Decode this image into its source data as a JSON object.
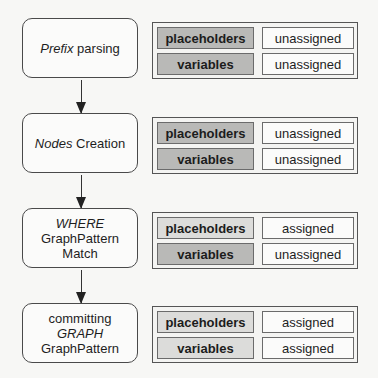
{
  "colors": {
    "label_unassigned": "#b9b9b7",
    "label_assigned": "#dcdcda",
    "value_bg": "#fbfbfa",
    "border": "#4a4a4a"
  },
  "stages": [
    {
      "id": "prefix-parsing",
      "lines": [
        {
          "parts": [
            {
              "text": "Prefix",
              "italic": true
            },
            {
              "text": " parsing",
              "italic": false
            }
          ]
        }
      ],
      "state": [
        {
          "label": "placeholders",
          "value": "unassigned"
        },
        {
          "label": "variables",
          "value": "unassigned"
        }
      ]
    },
    {
      "id": "nodes-creation",
      "lines": [
        {
          "parts": [
            {
              "text": "Nodes",
              "italic": true
            },
            {
              "text": " Creation",
              "italic": false
            }
          ]
        }
      ],
      "state": [
        {
          "label": "placeholders",
          "value": "unassigned"
        },
        {
          "label": "variables",
          "value": "unassigned"
        }
      ]
    },
    {
      "id": "where-graphpattern-match",
      "lines": [
        {
          "parts": [
            {
              "text": "WHERE",
              "italic": true
            }
          ]
        },
        {
          "parts": [
            {
              "text": "GraphPattern",
              "italic": false
            }
          ]
        },
        {
          "parts": [
            {
              "text": "Match",
              "italic": false
            }
          ]
        }
      ],
      "state": [
        {
          "label": "placeholders",
          "value": "assigned"
        },
        {
          "label": "variables",
          "value": "unassigned"
        }
      ]
    },
    {
      "id": "committing-graph-graphpattern",
      "lines": [
        {
          "parts": [
            {
              "text": "committing",
              "italic": false
            }
          ]
        },
        {
          "parts": [
            {
              "text": "GRAPH",
              "italic": true
            }
          ]
        },
        {
          "parts": [
            {
              "text": "GraphPattern",
              "italic": false
            }
          ]
        }
      ],
      "state": [
        {
          "label": "placeholders",
          "value": "assigned"
        },
        {
          "label": "variables",
          "value": "assigned"
        }
      ]
    }
  ],
  "flow": [
    {
      "from": "prefix-parsing",
      "to": "nodes-creation"
    },
    {
      "from": "nodes-creation",
      "to": "where-graphpattern-match"
    },
    {
      "from": "where-graphpattern-match",
      "to": "committing-graph-graphpattern"
    }
  ]
}
